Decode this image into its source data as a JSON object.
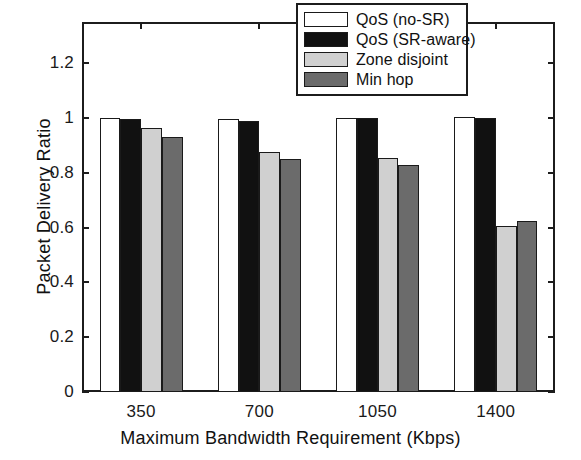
{
  "chart_data": {
    "type": "bar",
    "title": "",
    "xlabel": "Maximum Bandwidth Requirement (Kbps)",
    "ylabel": "Packet Delivery Ratio",
    "categories": [
      "350",
      "700",
      "1050",
      "1400"
    ],
    "ylim": [
      0,
      1.35
    ],
    "yticks": [
      "0",
      "0.2",
      "0.4",
      "0.6",
      "0.8",
      "1",
      "1.2"
    ],
    "ytick_values": [
      0,
      0.2,
      0.4,
      0.6,
      0.8,
      1,
      1.2
    ],
    "grid": false,
    "legend_position": "top-right",
    "series": [
      {
        "name": "QoS (no-SR)",
        "color": "#ffffff",
        "values": [
          1.0,
          0.995,
          1.0,
          1.005
        ]
      },
      {
        "name": "QoS (SR-aware)",
        "color": "#111111",
        "values": [
          0.995,
          0.988,
          1.0,
          0.998
        ]
      },
      {
        "name": "Zone disjoint",
        "color": "#d0d0d0",
        "values": [
          0.962,
          0.875,
          0.855,
          0.605
        ]
      },
      {
        "name": "Min hop",
        "color": "#6b6b6b",
        "values": [
          0.932,
          0.85,
          0.83,
          0.625
        ]
      }
    ]
  },
  "legend": {
    "entries": [
      {
        "label": "QoS (no-SR)",
        "color": "#ffffff"
      },
      {
        "label": "QoS (SR-aware)",
        "color": "#111111"
      },
      {
        "label": "Zone disjoint",
        "color": "#d0d0d0"
      },
      {
        "label": "Min hop",
        "color": "#6b6b6b"
      }
    ]
  },
  "axes": {
    "x_title": "Maximum Bandwidth Requirement (Kbps)",
    "y_title": "Packet Delivery Ratio"
  }
}
